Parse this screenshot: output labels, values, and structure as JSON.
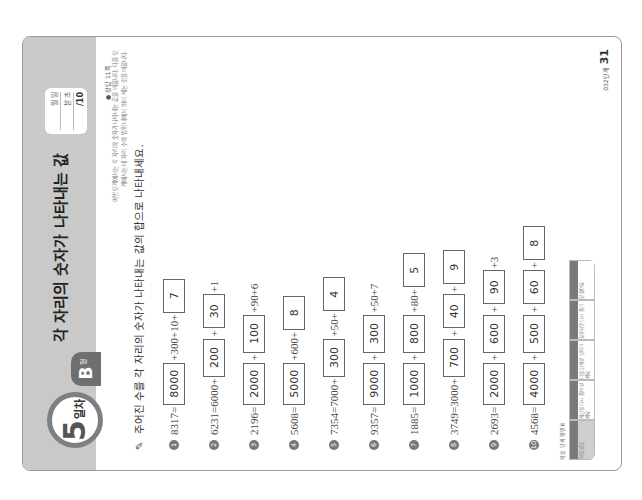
{
  "header": {
    "day_number": "5",
    "day_label": "일차",
    "type_letter": "B",
    "type_suffix": "형",
    "title": "각 자리의 숫자가 나타내는 값",
    "score_box": {
      "month_day": "월 일",
      "time": "분 초",
      "score": "/10"
    },
    "answer_ref": "● 정답 11쪽"
  },
  "intro_text": [
    "이번 단계에서는 각 자리의 숫자가 나타내는 값을 배웁니다. 다음 단",
    "계에서는 네 자리 수의 범위 내에서 뛰어 세는 것을 배웁니다."
  ],
  "instruction": "주어진 수를 각 자리의 숫자가 나타내는 값의 합으로 나타내세요.",
  "problems": [
    {
      "n": "1",
      "parts": [
        [
          "t",
          "8317="
        ],
        [
          "b",
          "8000",
          "w4"
        ],
        [
          "t",
          "+300+10+"
        ],
        [
          "b",
          "7",
          "w1"
        ]
      ]
    },
    {
      "n": "2",
      "parts": [
        [
          "t",
          "6231=6000+"
        ],
        [
          "b",
          "200",
          "w3"
        ],
        [
          "t",
          "+"
        ],
        [
          "b",
          "30",
          "w2"
        ],
        [
          "t",
          "+1"
        ]
      ]
    },
    {
      "n": "3",
      "parts": [
        [
          "t",
          "2196="
        ],
        [
          "b",
          "2000",
          "w4"
        ],
        [
          "t",
          "+"
        ],
        [
          "b",
          "100",
          "w3"
        ],
        [
          "t",
          "+90+6"
        ]
      ]
    },
    {
      "n": "4",
      "parts": [
        [
          "t",
          "5608="
        ],
        [
          "b",
          "5000",
          "w4"
        ],
        [
          "t",
          "+600+"
        ],
        [
          "b",
          "8",
          "w1"
        ]
      ]
    },
    {
      "n": "5",
      "parts": [
        [
          "t",
          "7354=7000+"
        ],
        [
          "b",
          "300",
          "w3"
        ],
        [
          "t",
          "+50+"
        ],
        [
          "b",
          "4",
          "w1"
        ]
      ]
    },
    {
      "n": "6",
      "parts": [
        [
          "t",
          "9357="
        ],
        [
          "b",
          "9000",
          "w4"
        ],
        [
          "t",
          "+"
        ],
        [
          "b",
          "300",
          "w3"
        ],
        [
          "t",
          "+50+7"
        ]
      ]
    },
    {
      "n": "7",
      "parts": [
        [
          "t",
          "1885="
        ],
        [
          "b",
          "1000",
          "w4"
        ],
        [
          "t",
          "+"
        ],
        [
          "b",
          "800",
          "w3"
        ],
        [
          "t",
          "+80+"
        ],
        [
          "b",
          "5",
          "w1"
        ]
      ]
    },
    {
      "n": "8",
      "parts": [
        [
          "t",
          "3749=3000+"
        ],
        [
          "b",
          "700",
          "w3"
        ],
        [
          "t",
          "+"
        ],
        [
          "b",
          "40",
          "w2"
        ],
        [
          "t",
          "+"
        ],
        [
          "b",
          "9",
          "w1"
        ]
      ]
    },
    {
      "n": "9",
      "parts": [
        [
          "t",
          "2693="
        ],
        [
          "b",
          "2000",
          "w4"
        ],
        [
          "t",
          "+"
        ],
        [
          "b",
          "600",
          "w3"
        ],
        [
          "t",
          "+"
        ],
        [
          "b",
          "90",
          "w2"
        ],
        [
          "t",
          "+3"
        ]
      ]
    },
    {
      "n": "10",
      "parts": [
        [
          "t",
          "4568="
        ],
        [
          "b",
          "4000",
          "w4"
        ],
        [
          "t",
          "+"
        ],
        [
          "b",
          "500",
          "w3"
        ],
        [
          "t",
          "+"
        ],
        [
          "b",
          "60",
          "w2"
        ],
        [
          "t",
          "+"
        ],
        [
          "b",
          "8",
          "w1"
        ]
      ]
    }
  ],
  "footer": {
    "note": "학습 단계 확인표",
    "table": [
      "학습 방법",
      "계산을 다시 풀어 보세요",
      "다음 단계로 넘어가세요",
      "실수하면 다시 풀기",
      "잘 했어요"
    ],
    "page_label": "032단계",
    "page_number": "31"
  },
  "colors": {
    "band": "#c9c9c9",
    "badge_ring": "#7f7f7f",
    "tab": "#6f6f6f",
    "border": "#9a9a9a"
  }
}
